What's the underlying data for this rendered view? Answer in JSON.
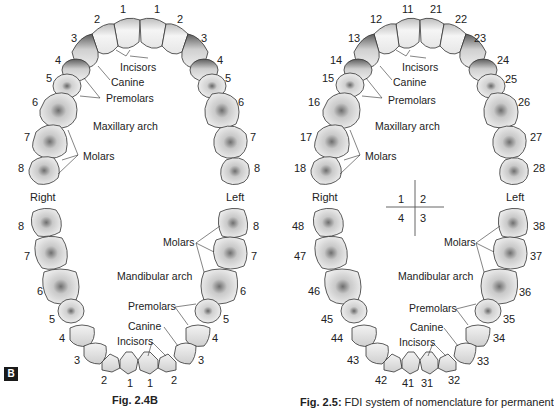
{
  "figure_b": {
    "badge": "B",
    "caption": "Fig. 2.4B",
    "side_right": "Right",
    "side_left": "Left",
    "upper_numbers": {
      "r1": "1",
      "r2": "2",
      "r3": "3",
      "r4": "4",
      "r5": "5",
      "r6": "6",
      "r7": "7",
      "r8": "8",
      "l1": "1",
      "l2": "2",
      "l3": "3",
      "l4": "4",
      "l5": "5",
      "l6": "6",
      "l7": "7",
      "l8": "8"
    },
    "lower_numbers": {
      "r1": "1",
      "r2": "2",
      "r3": "3",
      "r4": "4",
      "r5": "5",
      "r6": "6",
      "r7": "7",
      "r8": "8",
      "l1": "1",
      "l2": "2",
      "l3": "3",
      "l4": "4",
      "l5": "5",
      "l6": "6",
      "l7": "7",
      "l8": "8"
    },
    "upper_labels": {
      "incisors": "Incisors",
      "canine": "Canine",
      "premolars": "Premolars",
      "arch": "Maxillary arch",
      "molars": "Molars"
    },
    "lower_labels": {
      "molars": "Molars",
      "arch": "Mandibular arch",
      "premolars": "Premolars",
      "canine": "Canine",
      "incisors": "Incisors"
    }
  },
  "figure_fdi": {
    "caption_bold": "Fig. 2.5:",
    "caption_text": " FDI system of nomenclature for permanent",
    "side_right": "Right",
    "side_left": "Left",
    "quadrants": {
      "q1": "1",
      "q2": "2",
      "q3": "3",
      "q4": "4"
    },
    "upper_numbers": {
      "r1": "11",
      "r2": "12",
      "r3": "13",
      "r4": "14",
      "r5": "15",
      "r6": "16",
      "r7": "17",
      "r8": "18",
      "l1": "21",
      "l2": "22",
      "l3": "23",
      "l4": "24",
      "l5": "25",
      "l6": "26",
      "l7": "27",
      "l8": "28"
    },
    "lower_numbers": {
      "r1": "41",
      "r2": "42",
      "r3": "43",
      "r4": "44",
      "r5": "45",
      "r6": "46",
      "r7": "47",
      "r8": "48",
      "l1": "31",
      "l2": "32",
      "l3": "33",
      "l4": "34",
      "l5": "35",
      "l6": "36",
      "l7": "37",
      "l8": "38"
    },
    "upper_labels": {
      "incisors": "Incisors",
      "canine": "Canine",
      "premolars": "Premolars",
      "arch": "Maxillary arch",
      "molars": "Molars"
    },
    "lower_labels": {
      "molars": "Molars",
      "arch": "Mandibular arch",
      "premolars": "Premolars",
      "canine": "Canine",
      "incisors": "Incisors"
    }
  }
}
